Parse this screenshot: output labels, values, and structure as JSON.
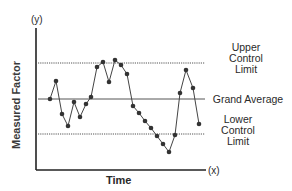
{
  "chart_data": {
    "type": "line",
    "title": "",
    "xlabel": "Time",
    "ylabel": "Measured Factor",
    "x_axis_marker": "(x)",
    "y_axis_marker": "(y)",
    "grid": false,
    "reference_lines": [
      {
        "name": "Upper Control Limit",
        "style": "dotted",
        "value": 63
      },
      {
        "name": "Grand Average",
        "style": "solid",
        "value": 99
      },
      {
        "name": "Lower Control Limit",
        "style": "dotted",
        "value": 134
      }
    ],
    "series": [
      {
        "name": "Measured Factor",
        "points": [
          [
            50,
            99
          ],
          [
            56,
            81
          ],
          [
            62,
            114
          ],
          [
            68,
            126
          ],
          [
            74,
            102
          ],
          [
            80,
            117
          ],
          [
            86,
            104
          ],
          [
            91,
            97
          ],
          [
            97,
            67
          ],
          [
            103,
            62
          ],
          [
            109,
            82
          ],
          [
            115,
            60
          ],
          [
            121,
            65
          ],
          [
            127,
            74
          ],
          [
            133,
            106
          ],
          [
            139,
            113
          ],
          [
            145,
            121
          ],
          [
            151,
            128
          ],
          [
            157,
            136
          ],
          [
            163,
            144
          ],
          [
            169,
            152
          ],
          [
            175,
            135
          ],
          [
            180,
            93
          ],
          [
            186,
            70
          ],
          [
            193,
            88
          ],
          [
            199,
            124
          ]
        ]
      }
    ]
  },
  "labels": {
    "y_marker": "(y)",
    "x_marker": "(x)",
    "ylabel": "Measured Factor",
    "xlabel": "Time",
    "ucl_line1": "Upper",
    "ucl_line2": "Control",
    "ucl_line3": "Limit",
    "avg": "Grand Average",
    "lcl_line1": "Lower",
    "lcl_line2": "Control",
    "lcl_line3": "Limit"
  }
}
